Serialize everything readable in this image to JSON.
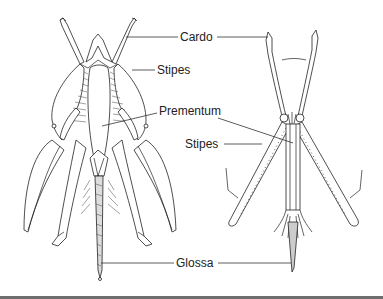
{
  "figure": {
    "labels": {
      "cardo": "Cardo",
      "stipes_upper": "Stipes",
      "prementum": "Prementum",
      "stipes_lower": "Stipes",
      "glossa": "Glossa"
    },
    "colors": {
      "ink": "#222222",
      "background": "#ffffff",
      "bottom_rule": "#6e6e6e"
    }
  }
}
